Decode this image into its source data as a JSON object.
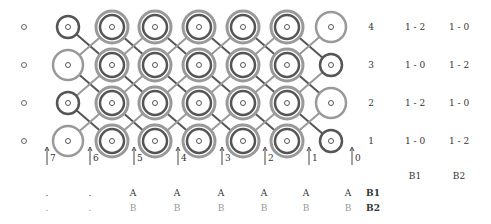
{
  "diagram": {
    "rows": [
      {
        "label": "4",
        "b1": "1 - 2",
        "b2": "1 - 0"
      },
      {
        "label": "3",
        "b1": "1 - 0",
        "b2": "1 - 2"
      },
      {
        "label": "2",
        "b1": "1 - 2",
        "b2": "1 - 0"
      },
      {
        "label": "1",
        "b1": "1 - 0",
        "b2": "1 - 2"
      }
    ],
    "column_headers": {
      "b1": "B1",
      "b2": "B2"
    },
    "arrows": [
      "7",
      "6",
      "5",
      "4",
      "3",
      "2",
      "1",
      "0"
    ],
    "bottom_rows": [
      {
        "label": "B1",
        "cells": [
          ".",
          ".",
          "A",
          "A",
          "A",
          "A",
          "A",
          "A"
        ]
      },
      {
        "label": "B2",
        "cells": [
          ".",
          ".",
          "B",
          "B",
          "B",
          "B",
          "B",
          "B"
        ]
      }
    ],
    "colors": {
      "dark": "#555555",
      "light": "#999999"
    }
  }
}
